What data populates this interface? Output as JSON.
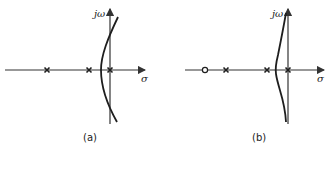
{
  "diagram": {
    "type": "root-locus",
    "panels": [
      {
        "id": "a",
        "caption": "(a)",
        "imag_axis_label": "jω",
        "real_axis_label": "σ",
        "poles_count": 3,
        "zeros_count": 0,
        "locus_shape": "single arc crossing imaginary axis, bowing left of origin"
      },
      {
        "id": "b",
        "caption": "(b)",
        "imag_axis_label": "jω",
        "real_axis_label": "σ",
        "poles_count": 3,
        "zeros_count": 1,
        "locus_shape": "S-shaped branch staying near and left of imaginary axis"
      }
    ]
  },
  "panel_a": {
    "caption": "(a)",
    "jw": "jω",
    "sigma": "σ"
  },
  "panel_b": {
    "caption": "(b)",
    "jw": "jω",
    "sigma": "σ"
  }
}
